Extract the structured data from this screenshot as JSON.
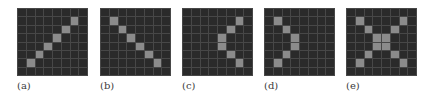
{
  "colors": {
    "background": "#ffffff",
    "cell_off": "#2a2a2a",
    "cell_on": "#8b8b8b",
    "gridline": "#474747"
  },
  "grid_size": {
    "rows": 8,
    "cols": 8
  },
  "panels": [
    {
      "label": "(a)",
      "left": 17,
      "on": [
        [
          1,
          6
        ],
        [
          2,
          5
        ],
        [
          3,
          4
        ],
        [
          4,
          3
        ],
        [
          5,
          2
        ],
        [
          6,
          1
        ]
      ]
    },
    {
      "label": "(b)",
      "left": 100,
      "on": [
        [
          1,
          1
        ],
        [
          2,
          2
        ],
        [
          3,
          3
        ],
        [
          4,
          4
        ],
        [
          5,
          5
        ],
        [
          6,
          6
        ]
      ]
    },
    {
      "label": "(c)",
      "left": 182,
      "on": [
        [
          1,
          6
        ],
        [
          2,
          5
        ],
        [
          3,
          4
        ],
        [
          4,
          4
        ],
        [
          5,
          5
        ],
        [
          6,
          6
        ]
      ]
    },
    {
      "label": "(d)",
      "left": 264,
      "on": [
        [
          1,
          1
        ],
        [
          2,
          2
        ],
        [
          3,
          3
        ],
        [
          4,
          3
        ],
        [
          5,
          2
        ],
        [
          6,
          1
        ]
      ]
    },
    {
      "label": "(e)",
      "left": 346,
      "on": [
        [
          1,
          1
        ],
        [
          1,
          6
        ],
        [
          2,
          2
        ],
        [
          2,
          5
        ],
        [
          3,
          3
        ],
        [
          3,
          4
        ],
        [
          4,
          3
        ],
        [
          4,
          4
        ],
        [
          5,
          2
        ],
        [
          5,
          5
        ],
        [
          6,
          1
        ],
        [
          6,
          6
        ]
      ]
    }
  ]
}
